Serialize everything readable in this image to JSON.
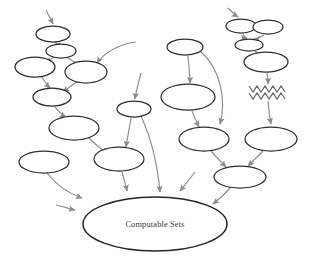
{
  "diagram": {
    "background_color": "#ffffff",
    "node_stroke_color": "#2e2e2e",
    "edge_color": "#8c8c8c",
    "label_color": "#3a3a3a",
    "main_node": {
      "label": "Computable Sets",
      "cx": 155,
      "cy": 224,
      "rx": 72,
      "ry": 27
    },
    "nodes": [
      {
        "id": "n1",
        "label": "",
        "cx": 53,
        "cy": 34,
        "rx": 17,
        "ry": 8
      },
      {
        "id": "n2",
        "label": "",
        "cx": 61,
        "cy": 51,
        "rx": 15,
        "ry": 7
      },
      {
        "id": "n3",
        "label": "",
        "cx": 35,
        "cy": 67,
        "rx": 20,
        "ry": 10
      },
      {
        "id": "n4",
        "label": "",
        "cx": 86,
        "cy": 72,
        "rx": 21,
        "ry": 11
      },
      {
        "id": "n5",
        "label": "",
        "cx": 52,
        "cy": 97,
        "rx": 19,
        "ry": 9
      },
      {
        "id": "n6",
        "label": "",
        "cx": 74,
        "cy": 128,
        "rx": 25,
        "ry": 12
      },
      {
        "id": "n7",
        "label": "",
        "cx": 44,
        "cy": 162,
        "rx": 25,
        "ry": 11
      },
      {
        "id": "n8",
        "label": "",
        "cx": 119,
        "cy": 159,
        "rx": 25,
        "ry": 12
      },
      {
        "id": "n9",
        "label": "",
        "cx": 134,
        "cy": 109,
        "rx": 17,
        "ry": 8
      },
      {
        "id": "n10",
        "label": "",
        "cx": 185,
        "cy": 47,
        "rx": 18,
        "ry": 8
      },
      {
        "id": "n11",
        "label": "",
        "cx": 188,
        "cy": 97,
        "rx": 27,
        "ry": 13
      },
      {
        "id": "n12",
        "label": "",
        "cx": 241,
        "cy": 26,
        "rx": 15,
        "ry": 7
      },
      {
        "id": "n13",
        "label": "",
        "cx": 268,
        "cy": 27,
        "rx": 15,
        "ry": 7
      },
      {
        "id": "n14",
        "label": "",
        "cx": 249,
        "cy": 45,
        "rx": 14,
        "ry": 6
      },
      {
        "id": "n15",
        "label": "",
        "cx": 266,
        "cy": 62,
        "rx": 22,
        "ry": 10
      },
      {
        "id": "n16",
        "label": "",
        "cx": 204,
        "cy": 139,
        "rx": 25,
        "ry": 12
      },
      {
        "id": "n17",
        "label": "",
        "cx": 271,
        "cy": 139,
        "rx": 26,
        "ry": 12
      },
      {
        "id": "n18",
        "label": "",
        "cx": 240,
        "cy": 177,
        "rx": 26,
        "ry": 11
      }
    ],
    "special_nodes": [
      {
        "id": "zigzag",
        "shape": "zigzag-scribble",
        "cx": 268,
        "cy": 93,
        "width": 38,
        "rows": 2,
        "teeth": 5
      }
    ],
    "edge_count": 24,
    "stub_arrows": 4
  }
}
